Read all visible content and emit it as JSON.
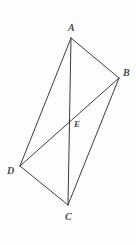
{
  "figure": {
    "type": "geometry-diagram",
    "background_color": "#fdfdfd",
    "stroke_color": "#3c3c3c",
    "label_color": "#4a4a4a",
    "stroke_width": 1,
    "canvas": {
      "width": 136,
      "height": 245
    },
    "points": [
      {
        "id": "A",
        "label": "A",
        "x": 71,
        "y": 38,
        "label_x": 68,
        "label_y": 23
      },
      {
        "id": "B",
        "label": "B",
        "x": 119,
        "y": 78,
        "label_x": 123,
        "label_y": 68
      },
      {
        "id": "C",
        "label": "C",
        "x": 68,
        "y": 205,
        "label_x": 65,
        "label_y": 212
      },
      {
        "id": "D",
        "label": "D",
        "x": 20,
        "y": 166,
        "label_x": 7,
        "label_y": 166
      },
      {
        "id": "E",
        "label": "E",
        "x": 70,
        "y": 119,
        "label_x": 74,
        "label_y": 119
      }
    ],
    "segments": [
      {
        "id": "AB",
        "from": "A",
        "to": "B",
        "role": "side",
        "x1": 71,
        "y1": 38,
        "x2": 119,
        "y2": 78
      },
      {
        "id": "BC",
        "from": "B",
        "to": "C",
        "role": "side",
        "x1": 119,
        "y1": 78,
        "x2": 68,
        "y2": 205
      },
      {
        "id": "CD",
        "from": "C",
        "to": "D",
        "role": "side",
        "x1": 68,
        "y1": 205,
        "x2": 20,
        "y2": 166
      },
      {
        "id": "DA",
        "from": "D",
        "to": "A",
        "role": "side",
        "x1": 20,
        "y1": 166,
        "x2": 71,
        "y2": 38
      },
      {
        "id": "AC",
        "from": "A",
        "to": "C",
        "role": "diagonal",
        "x1": 71,
        "y1": 38,
        "x2": 68,
        "y2": 205
      },
      {
        "id": "DB",
        "from": "D",
        "to": "B",
        "role": "diagonal",
        "x1": 20,
        "y1": 166,
        "x2": 119,
        "y2": 78
      }
    ]
  }
}
